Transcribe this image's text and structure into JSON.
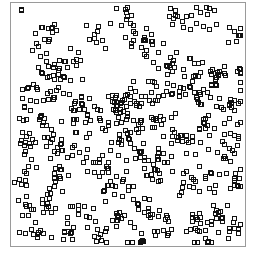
{
  "chart_data": {
    "type": "scatter",
    "title": "",
    "xlabel": "",
    "ylabel": "",
    "xlim": [
      0,
      100
    ],
    "ylim": [
      0,
      100
    ],
    "grid": false,
    "legend": null,
    "marker": "open-square",
    "marker_color": "#111111",
    "frame_color": "#9a9a9a",
    "note": "Clustered spatial point pattern; y measured upward from bottom of frame. Clusters listed as center, approximate point count, and spread (std dev); points generated deterministically from these.",
    "clusters": [
      {
        "x": 4,
        "y": 97,
        "n": 2,
        "s": 1.0
      },
      {
        "x": 16,
        "y": 90,
        "n": 10,
        "s": 3.0
      },
      {
        "x": 12,
        "y": 82,
        "n": 8,
        "s": 3.0
      },
      {
        "x": 26,
        "y": 75,
        "n": 12,
        "s": 3.5
      },
      {
        "x": 18,
        "y": 72,
        "n": 14,
        "s": 3.0
      },
      {
        "x": 38,
        "y": 88,
        "n": 10,
        "s": 3.0
      },
      {
        "x": 47,
        "y": 96,
        "n": 8,
        "s": 3.0
      },
      {
        "x": 60,
        "y": 83,
        "n": 10,
        "s": 3.0
      },
      {
        "x": 53,
        "y": 87,
        "n": 12,
        "s": 3.5
      },
      {
        "x": 71,
        "y": 93,
        "n": 10,
        "s": 3.0
      },
      {
        "x": 84,
        "y": 95,
        "n": 12,
        "s": 3.5
      },
      {
        "x": 98,
        "y": 88,
        "n": 8,
        "s": 2.5
      },
      {
        "x": 66,
        "y": 75,
        "n": 14,
        "s": 3.5
      },
      {
        "x": 78,
        "y": 74,
        "n": 12,
        "s": 3.5
      },
      {
        "x": 89,
        "y": 70,
        "n": 16,
        "s": 3.0
      },
      {
        "x": 95,
        "y": 60,
        "n": 14,
        "s": 3.0
      },
      {
        "x": 99,
        "y": 72,
        "n": 8,
        "s": 2.0
      },
      {
        "x": 8,
        "y": 64,
        "n": 12,
        "s": 3.0
      },
      {
        "x": 18,
        "y": 62,
        "n": 12,
        "s": 3.0
      },
      {
        "x": 30,
        "y": 59,
        "n": 12,
        "s": 3.0
      },
      {
        "x": 44,
        "y": 59,
        "n": 14,
        "s": 3.5
      },
      {
        "x": 52,
        "y": 62,
        "n": 14,
        "s": 3.5
      },
      {
        "x": 62,
        "y": 63,
        "n": 14,
        "s": 3.0
      },
      {
        "x": 72,
        "y": 63,
        "n": 12,
        "s": 3.0
      },
      {
        "x": 82,
        "y": 62,
        "n": 12,
        "s": 3.0
      },
      {
        "x": 7,
        "y": 53,
        "n": 10,
        "s": 3.0
      },
      {
        "x": 14,
        "y": 48,
        "n": 10,
        "s": 3.0
      },
      {
        "x": 26,
        "y": 52,
        "n": 10,
        "s": 3.0
      },
      {
        "x": 36,
        "y": 50,
        "n": 10,
        "s": 3.0
      },
      {
        "x": 46,
        "y": 53,
        "n": 12,
        "s": 3.0
      },
      {
        "x": 52,
        "y": 48,
        "n": 14,
        "s": 3.5
      },
      {
        "x": 62,
        "y": 52,
        "n": 10,
        "s": 3.0
      },
      {
        "x": 72,
        "y": 45,
        "n": 10,
        "s": 3.0
      },
      {
        "x": 85,
        "y": 50,
        "n": 10,
        "s": 3.0
      },
      {
        "x": 95,
        "y": 46,
        "n": 10,
        "s": 3.0
      },
      {
        "x": 5,
        "y": 40,
        "n": 10,
        "s": 3.0
      },
      {
        "x": 19,
        "y": 40,
        "n": 12,
        "s": 3.0
      },
      {
        "x": 28,
        "y": 35,
        "n": 10,
        "s": 3.0
      },
      {
        "x": 38,
        "y": 35,
        "n": 10,
        "s": 3.0
      },
      {
        "x": 48,
        "y": 40,
        "n": 10,
        "s": 3.0
      },
      {
        "x": 56,
        "y": 38,
        "n": 12,
        "s": 3.0
      },
      {
        "x": 66,
        "y": 36,
        "n": 10,
        "s": 3.0
      },
      {
        "x": 78,
        "y": 42,
        "n": 10,
        "s": 3.0
      },
      {
        "x": 92,
        "y": 40,
        "n": 12,
        "s": 3.0
      },
      {
        "x": 6,
        "y": 28,
        "n": 10,
        "s": 3.0
      },
      {
        "x": 20,
        "y": 27,
        "n": 14,
        "s": 3.0
      },
      {
        "x": 40,
        "y": 26,
        "n": 14,
        "s": 3.5
      },
      {
        "x": 50,
        "y": 24,
        "n": 10,
        "s": 3.0
      },
      {
        "x": 60,
        "y": 28,
        "n": 12,
        "s": 3.0
      },
      {
        "x": 76,
        "y": 25,
        "n": 12,
        "s": 3.0
      },
      {
        "x": 86,
        "y": 28,
        "n": 10,
        "s": 3.0
      },
      {
        "x": 97,
        "y": 26,
        "n": 10,
        "s": 2.5
      },
      {
        "x": 5,
        "y": 15,
        "n": 8,
        "s": 3.0
      },
      {
        "x": 14,
        "y": 14,
        "n": 10,
        "s": 3.0
      },
      {
        "x": 30,
        "y": 12,
        "n": 12,
        "s": 3.0
      },
      {
        "x": 46,
        "y": 10,
        "n": 12,
        "s": 3.0
      },
      {
        "x": 58,
        "y": 14,
        "n": 12,
        "s": 3.5
      },
      {
        "x": 68,
        "y": 8,
        "n": 10,
        "s": 3.0
      },
      {
        "x": 80,
        "y": 10,
        "n": 12,
        "s": 3.0
      },
      {
        "x": 90,
        "y": 13,
        "n": 12,
        "s": 3.0
      },
      {
        "x": 97,
        "y": 6,
        "n": 10,
        "s": 2.5
      },
      {
        "x": 10,
        "y": 4,
        "n": 10,
        "s": 2.5
      },
      {
        "x": 22,
        "y": 4,
        "n": 10,
        "s": 2.5
      },
      {
        "x": 38,
        "y": 4,
        "n": 10,
        "s": 2.5
      },
      {
        "x": 56,
        "y": 3,
        "n": 10,
        "s": 2.5
      },
      {
        "x": 84,
        "y": 3,
        "n": 10,
        "s": 2.5
      }
    ]
  }
}
